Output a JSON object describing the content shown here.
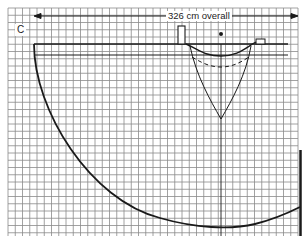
{
  "figure": {
    "panel_label": "C",
    "dimension_label": "326 cm overall",
    "colors": {
      "grid": "#8a8a8a",
      "ink": "#1a1a1a",
      "background": "#ffffff"
    },
    "grid": {
      "x0": 8,
      "y0": 8,
      "x1": 298,
      "y1": 236,
      "pitch": 7.25
    }
  }
}
